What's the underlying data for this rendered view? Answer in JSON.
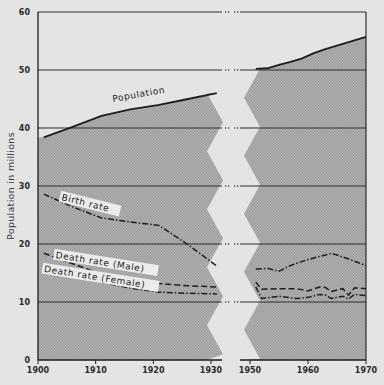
{
  "chart_data": {
    "type": "line",
    "title": "",
    "xlabel": "",
    "ylabel": "Population in millions",
    "ylim": [
      0,
      60
    ],
    "yticks": [
      0,
      10,
      20,
      30,
      40,
      50,
      60
    ],
    "xticks": [
      1900,
      1910,
      1920,
      1930,
      1950,
      1960,
      1970
    ],
    "x_break": {
      "from": 1931,
      "to": 1951,
      "style": "zigzag"
    },
    "grid": "horizontal",
    "legend": "inline labels",
    "series": [
      {
        "name": "Population",
        "style": "solid",
        "filled": true,
        "segments": [
          {
            "x": [
              1901,
              1906,
              1911,
              1916,
              1921,
              1926,
              1931
            ],
            "y": [
              38.4,
              40.2,
              42.1,
              43.2,
              44.0,
              45.0,
              46.0
            ]
          },
          {
            "x": [
              1951,
              1953,
              1955,
              1957,
              1959,
              1961,
              1963,
              1965,
              1967,
              1969,
              1970
            ],
            "y": [
              50.2,
              50.3,
              50.9,
              51.4,
              52.0,
              52.9,
              53.6,
              54.2,
              54.8,
              55.4,
              55.7
            ]
          }
        ]
      },
      {
        "name": "Birth rate",
        "style": "dash-dot",
        "segments": [
          {
            "x": [
              1901,
              1906,
              1911,
              1916,
              1921,
              1926,
              1931
            ],
            "y": [
              28.6,
              26.4,
              24.5,
              23.8,
              23.2,
              19.9,
              16.2
            ]
          },
          {
            "x": [
              1951,
              1953,
              1955,
              1957,
              1959,
              1961,
              1963,
              1964,
              1965,
              1967,
              1970
            ],
            "y": [
              15.7,
              15.8,
              15.3,
              16.3,
              17.0,
              17.6,
              18.1,
              18.4,
              18.1,
              17.4,
              16.3
            ]
          }
        ]
      },
      {
        "name": "Death rate (Male)",
        "style": "dashed",
        "segments": [
          {
            "x": [
              1901,
              1906,
              1911,
              1916,
              1921,
              1926,
              1931
            ],
            "y": [
              18.4,
              16.6,
              14.8,
              13.8,
              13.2,
              12.8,
              12.6
            ]
          },
          {
            "x": [
              1951,
              1952,
              1955,
              1958,
              1960,
              1962,
              1963,
              1964,
              1966,
              1967,
              1968,
              1969,
              1970
            ],
            "y": [
              13.4,
              12.2,
              12.3,
              12.3,
              11.9,
              12.6,
              12.5,
              11.8,
              12.3,
              11.2,
              12.4,
              12.4,
              12.3
            ]
          }
        ]
      },
      {
        "name": "Death rate (Female)",
        "style": "dash-dot",
        "segments": [
          {
            "x": [
              1901,
              1906,
              1911,
              1916,
              1921,
              1926,
              1931
            ],
            "y": [
              16.4,
              14.7,
              13.4,
              12.4,
              11.7,
              11.5,
              11.4
            ]
          },
          {
            "x": [
              1951,
              1952,
              1955,
              1958,
              1960,
              1962,
              1963,
              1964,
              1966,
              1967,
              1968,
              1969,
              1970
            ],
            "y": [
              12.6,
              10.6,
              11.0,
              10.6,
              10.8,
              11.3,
              11.2,
              10.6,
              11.0,
              10.5,
              11.3,
              11.2,
              11.1
            ]
          }
        ]
      }
    ],
    "annotations": [
      {
        "text": "Population",
        "x": 1913,
        "y": 44.5,
        "rotate": -10
      },
      {
        "text": "Birth rate",
        "x": 1904,
        "y": 27.6,
        "rotate": 14
      },
      {
        "text": "Death rate (Male)",
        "x": 1903,
        "y": 17.6,
        "rotate": 9
      },
      {
        "text": "Death rate (Female)",
        "x": 1901,
        "y": 15.2,
        "rotate": 9
      }
    ]
  },
  "colors": {
    "background": "#e4e4e4",
    "fill": "#a9a9a9",
    "line": "#1e1e1e",
    "grid": "#2e2e2e",
    "break_gap": "#ececec"
  }
}
